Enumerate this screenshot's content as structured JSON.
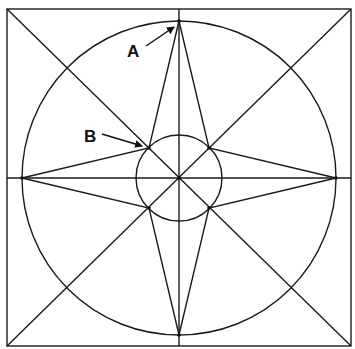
{
  "figure": {
    "type": "geometric-construction",
    "labels": [
      {
        "id": "A",
        "text": "A",
        "points_to": "top vertex of star on outer circle"
      },
      {
        "id": "B",
        "text": "B",
        "points_to": "intersection of diagonal with inner circle (inner star vertex)"
      }
    ],
    "colors": {
      "stroke": "#1a1a1a",
      "background": "#ffffff",
      "label": "#111111"
    },
    "geometry": {
      "square": {
        "x1": 7,
        "y1": 9,
        "x2": 351,
        "y2": 346
      },
      "center": {
        "x": 179,
        "y": 178
      },
      "outer_circle_radius": 157,
      "inner_circle_radius": 43,
      "inner_vertex_offset": 30
    }
  }
}
